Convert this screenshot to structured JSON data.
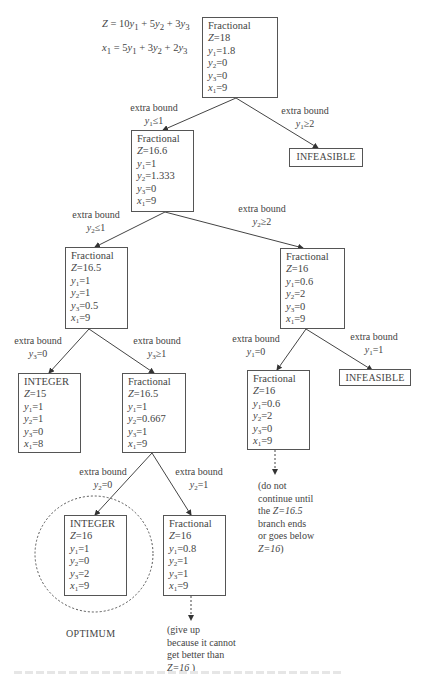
{
  "equations": {
    "objective": {
      "lhs": "Z",
      "terms": [
        [
          "10",
          "y",
          "1"
        ],
        [
          "5",
          "y",
          "2"
        ],
        [
          "3",
          "y",
          "3"
        ]
      ]
    },
    "constraint": {
      "lhs_var": "x",
      "lhs_sub": "1",
      "terms": [
        [
          "5",
          "y",
          "1"
        ],
        [
          "3",
          "y",
          "2"
        ],
        [
          "2",
          "y",
          "3"
        ]
      ]
    }
  },
  "nodes": [
    {
      "id": "root",
      "status": "Fractional",
      "Z": "18",
      "y1": "1.8",
      "y2": "0",
      "y3": "0",
      "x1": "9"
    },
    {
      "id": "n2",
      "status": "Fractional",
      "Z": "16.6",
      "y1": "1",
      "y2": "1.333",
      "y3": "0",
      "x1": "9"
    },
    {
      "id": "n3",
      "status": "Fractional",
      "Z": "16.5",
      "y1": "1",
      "y2": "1",
      "y3": "0.5",
      "x1": "9"
    },
    {
      "id": "n4",
      "status": "Fractional",
      "Z": "16",
      "y1": "0.6",
      "y2": "2",
      "y3": "0",
      "x1": "9"
    },
    {
      "id": "n5",
      "status": "INTEGER",
      "Z": "15",
      "y1": "1",
      "y2": "1",
      "y3": "0",
      "x1": "8"
    },
    {
      "id": "n6",
      "status": "Fractional",
      "Z": "16.5",
      "y1": "1",
      "y2": "0.667",
      "y3": "1",
      "x1": "9"
    },
    {
      "id": "n7",
      "status": "Fractional",
      "Z": "16",
      "y1": "0.6",
      "y2": "2",
      "y3": "0",
      "x1": "9"
    },
    {
      "id": "n8",
      "status": "INTEGER",
      "Z": "16",
      "y1": "1",
      "y2": "0",
      "y3": "2",
      "x1": "9"
    },
    {
      "id": "n9",
      "status": "Fractional",
      "Z": "16",
      "y1": "0.8",
      "y2": "1",
      "y3": "1",
      "x1": "9"
    }
  ],
  "infeasible": {
    "label": "INFEASIBLE"
  },
  "edge_labels": [
    {
      "title": "extra bound",
      "var": "y",
      "sub": "1",
      "rel": "≤1"
    },
    {
      "title": "extra bound",
      "var": "y",
      "sub": "1",
      "rel": "≥2"
    },
    {
      "title": "extra bound",
      "var": "y",
      "sub": "2",
      "rel": "≤1"
    },
    {
      "title": "extra bound",
      "var": "y",
      "sub": "2",
      "rel": "≥2"
    },
    {
      "title": "extra bound",
      "var": "y",
      "sub": "3",
      "rel": "=0"
    },
    {
      "title": "extra bound",
      "var": "y",
      "sub": "3",
      "rel": "≥1"
    },
    {
      "title": "extra bound",
      "var": "y",
      "sub": "1",
      "rel": "=0"
    },
    {
      "title": "extra bound",
      "var": "y",
      "sub": "1",
      "rel": "=1"
    },
    {
      "title": "extra bound",
      "var": "y",
      "sub": "2",
      "rel": "=0"
    },
    {
      "title": "extra bound",
      "var": "y",
      "sub": "2",
      "rel": "=1"
    }
  ],
  "notes": {
    "wait": {
      "lines": [
        "(do not",
        "continue until",
        "the "
      ],
      "z_italic": "Z=16.5",
      "lines_after": [
        "branch ends",
        "or goes below"
      ],
      "last_italic": "Z=16",
      "last_tail": ")"
    },
    "giveup": {
      "lines": [
        "(give up",
        "because it cannot",
        "get better than"
      ],
      "last_italic": "Z=16",
      "last_tail": " )"
    }
  },
  "optimum_label": "OPTIMUM",
  "colors": {
    "line": "#444444",
    "box_border": "#555555",
    "text": "#444444",
    "background": "#ffffff"
  }
}
